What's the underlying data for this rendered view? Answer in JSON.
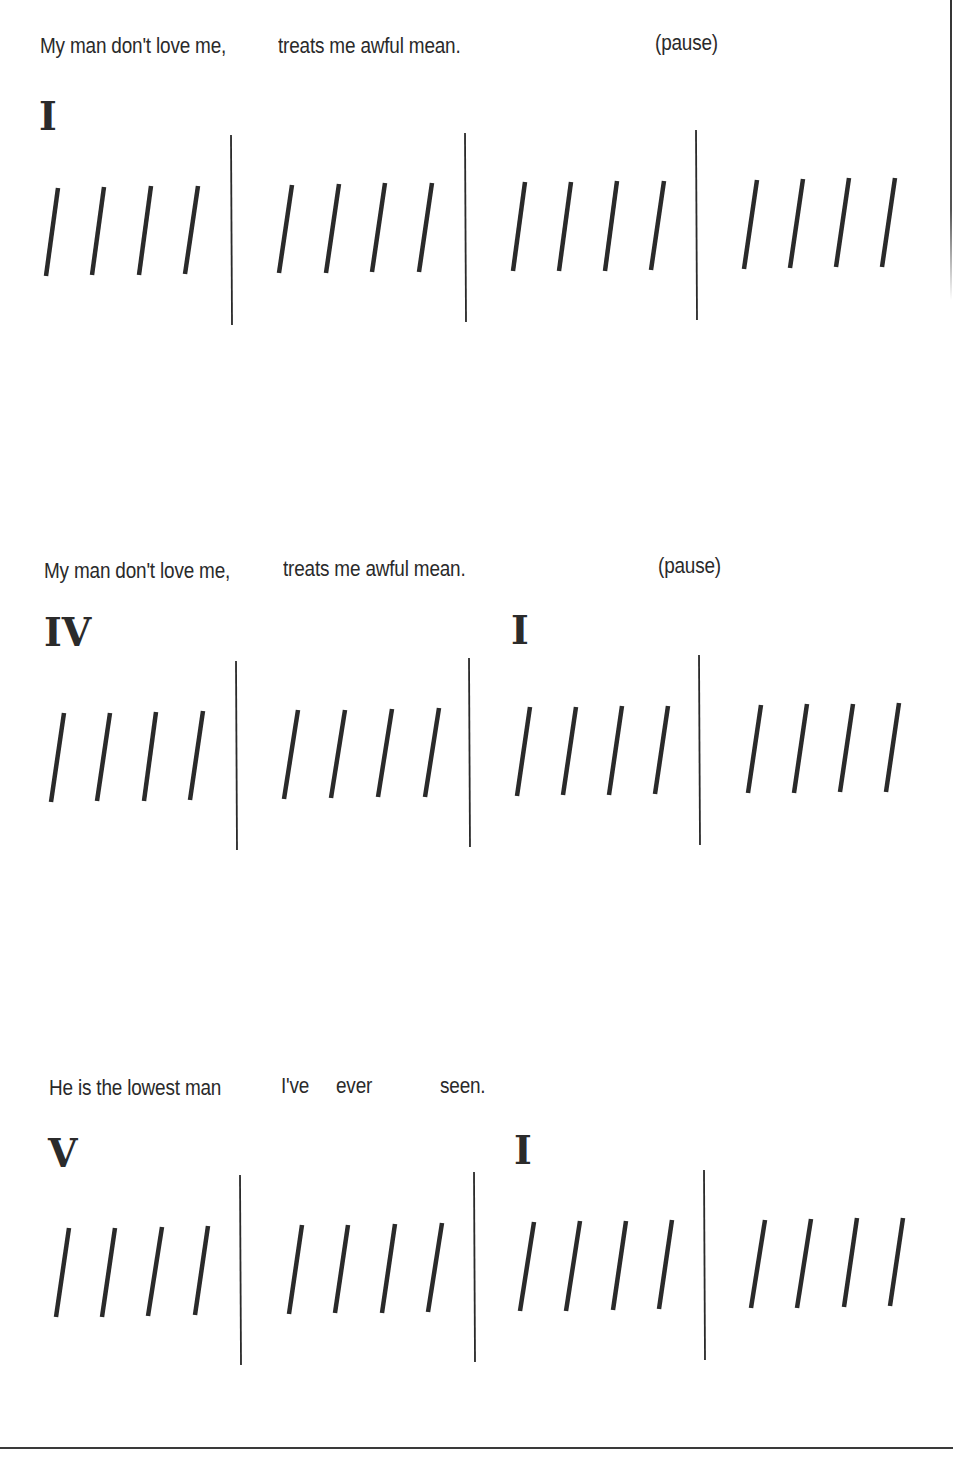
{
  "document": {
    "type": "blues rhythm / chord chart",
    "colors": {
      "ink": "#2a2a2a",
      "background": "#ffffff"
    },
    "systems": [
      {
        "lyrics": [
          {
            "text": "My man don't love me,",
            "x": 40,
            "y": 33
          },
          {
            "text": "treats me awful mean.",
            "x": 278,
            "y": 33
          },
          {
            "text": "(pause)",
            "x": 655,
            "y": 30
          }
        ],
        "chords": [
          {
            "label": "I",
            "x": 39,
            "y": 96
          }
        ],
        "measures": 4,
        "beats_per_measure": 4,
        "barlines": [
          {
            "x": 231,
            "y1": 135,
            "y2": 325
          },
          {
            "x": 465,
            "y1": 133,
            "y2": 322
          },
          {
            "x": 696,
            "y1": 130,
            "y2": 320
          }
        ],
        "strokes": [
          {
            "x1": 58,
            "y1": 188,
            "x2": 46,
            "y2": 276
          },
          {
            "x1": 104,
            "y1": 187,
            "x2": 92,
            "y2": 275
          },
          {
            "x1": 151,
            "y1": 186,
            "x2": 139,
            "y2": 275
          },
          {
            "x1": 198,
            "y1": 186,
            "x2": 185,
            "y2": 274
          },
          {
            "x1": 292,
            "y1": 185,
            "x2": 279,
            "y2": 273
          },
          {
            "x1": 339,
            "y1": 184,
            "x2": 326,
            "y2": 273
          },
          {
            "x1": 385,
            "y1": 183,
            "x2": 372,
            "y2": 272
          },
          {
            "x1": 432,
            "y1": 183,
            "x2": 419,
            "y2": 272
          },
          {
            "x1": 525,
            "y1": 182,
            "x2": 513,
            "y2": 271
          },
          {
            "x1": 571,
            "y1": 182,
            "x2": 559,
            "y2": 271
          },
          {
            "x1": 617,
            "y1": 181,
            "x2": 605,
            "y2": 271
          },
          {
            "x1": 664,
            "y1": 181,
            "x2": 651,
            "y2": 270
          },
          {
            "x1": 757,
            "y1": 180,
            "x2": 744,
            "y2": 269
          },
          {
            "x1": 803,
            "y1": 179,
            "x2": 790,
            "y2": 268
          },
          {
            "x1": 849,
            "y1": 178,
            "x2": 836,
            "y2": 267
          },
          {
            "x1": 895,
            "y1": 178,
            "x2": 882,
            "y2": 267
          }
        ]
      },
      {
        "lyrics": [
          {
            "text": "My man don't love me,",
            "x": 44,
            "y": 558
          },
          {
            "text": "treats me awful mean.",
            "x": 283,
            "y": 556
          },
          {
            "text": "(pause)",
            "x": 658,
            "y": 553
          }
        ],
        "chords": [
          {
            "label": "IV",
            "x": 44,
            "y": 612
          },
          {
            "label": "I",
            "x": 511,
            "y": 610
          }
        ],
        "measures": 4,
        "beats_per_measure": 4,
        "barlines": [
          {
            "x": 236,
            "y1": 661,
            "y2": 850
          },
          {
            "x": 469,
            "y1": 658,
            "y2": 847
          },
          {
            "x": 699,
            "y1": 655,
            "y2": 845
          }
        ],
        "strokes": [
          {
            "x1": 64,
            "y1": 713,
            "x2": 51,
            "y2": 802
          },
          {
            "x1": 110,
            "y1": 713,
            "x2": 97,
            "y2": 801
          },
          {
            "x1": 156,
            "y1": 712,
            "x2": 144,
            "y2": 801
          },
          {
            "x1": 203,
            "y1": 711,
            "x2": 190,
            "y2": 800
          },
          {
            "x1": 298,
            "y1": 710,
            "x2": 284,
            "y2": 799
          },
          {
            "x1": 345,
            "y1": 710,
            "x2": 331,
            "y2": 798
          },
          {
            "x1": 392,
            "y1": 709,
            "x2": 378,
            "y2": 797
          },
          {
            "x1": 439,
            "y1": 708,
            "x2": 425,
            "y2": 797
          },
          {
            "x1": 530,
            "y1": 707,
            "x2": 517,
            "y2": 796
          },
          {
            "x1": 576,
            "y1": 707,
            "x2": 563,
            "y2": 795
          },
          {
            "x1": 622,
            "y1": 706,
            "x2": 609,
            "y2": 795
          },
          {
            "x1": 668,
            "y1": 706,
            "x2": 655,
            "y2": 794
          },
          {
            "x1": 761,
            "y1": 705,
            "x2": 748,
            "y2": 793
          },
          {
            "x1": 807,
            "y1": 704,
            "x2": 794,
            "y2": 793
          },
          {
            "x1": 853,
            "y1": 704,
            "x2": 840,
            "y2": 792
          },
          {
            "x1": 899,
            "y1": 703,
            "x2": 886,
            "y2": 792
          }
        ]
      },
      {
        "lyrics": [
          {
            "text": "He is the lowest man",
            "x": 49,
            "y": 1075
          },
          {
            "text": "I've",
            "x": 281,
            "y": 1073
          },
          {
            "text": "ever",
            "x": 336,
            "y": 1073
          },
          {
            "text": "seen.",
            "x": 440,
            "y": 1073
          }
        ],
        "chords": [
          {
            "label": "V",
            "x": 48,
            "y": 1133
          },
          {
            "label": "I",
            "x": 514,
            "y": 1130
          }
        ],
        "measures": 4,
        "beats_per_measure": 4,
        "barlines": [
          {
            "x": 240,
            "y1": 1175,
            "y2": 1365
          },
          {
            "x": 474,
            "y1": 1172,
            "y2": 1362
          },
          {
            "x": 704,
            "y1": 1170,
            "y2": 1360
          }
        ],
        "strokes": [
          {
            "x1": 69,
            "y1": 1228,
            "x2": 56,
            "y2": 1317
          },
          {
            "x1": 115,
            "y1": 1228,
            "x2": 102,
            "y2": 1317
          },
          {
            "x1": 162,
            "y1": 1227,
            "x2": 148,
            "y2": 1316
          },
          {
            "x1": 208,
            "y1": 1226,
            "x2": 195,
            "y2": 1315
          },
          {
            "x1": 302,
            "y1": 1225,
            "x2": 289,
            "y2": 1314
          },
          {
            "x1": 348,
            "y1": 1225,
            "x2": 335,
            "y2": 1313
          },
          {
            "x1": 395,
            "y1": 1224,
            "x2": 382,
            "y2": 1313
          },
          {
            "x1": 442,
            "y1": 1223,
            "x2": 428,
            "y2": 1312
          },
          {
            "x1": 534,
            "y1": 1222,
            "x2": 520,
            "y2": 1311
          },
          {
            "x1": 580,
            "y1": 1221,
            "x2": 566,
            "y2": 1311
          },
          {
            "x1": 626,
            "y1": 1221,
            "x2": 613,
            "y2": 1310
          },
          {
            "x1": 672,
            "y1": 1220,
            "x2": 659,
            "y2": 1309
          },
          {
            "x1": 765,
            "y1": 1220,
            "x2": 751,
            "y2": 1308
          },
          {
            "x1": 811,
            "y1": 1219,
            "x2": 797,
            "y2": 1308
          },
          {
            "x1": 857,
            "y1": 1218,
            "x2": 844,
            "y2": 1307
          },
          {
            "x1": 903,
            "y1": 1218,
            "x2": 890,
            "y2": 1306
          }
        ]
      }
    ]
  }
}
